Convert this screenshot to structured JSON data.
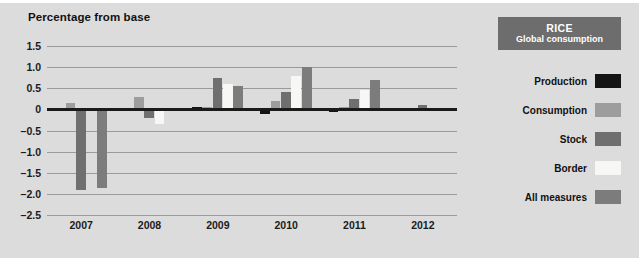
{
  "figure": {
    "background_color": "#dcdcdc",
    "axis_title": "Percentage from base"
  },
  "header": {
    "commodity": "RICE",
    "subtitle": "Global consumption",
    "background_color": "#6d6d6d",
    "text_color": "#ffffff"
  },
  "legend": {
    "position": "right",
    "items": [
      {
        "label": "Production",
        "color": "#141414"
      },
      {
        "label": "Consumption",
        "color": "#9d9d9d"
      },
      {
        "label": "Stock",
        "color": "#6f6f6f"
      },
      {
        "label": "Border",
        "color": "#f7f7f5"
      },
      {
        "label": "All measures",
        "color": "#7c7c7c"
      }
    ]
  },
  "chart_data": {
    "type": "bar",
    "title": "",
    "subtitle": "",
    "xlabel": "",
    "ylabel": "Percentage from base",
    "categories": [
      "2007",
      "2008",
      "2009",
      "2010",
      "2011",
      "2012"
    ],
    "series": [
      {
        "name": "Production",
        "color": "#141414",
        "values": [
          0.0,
          -0.02,
          0.05,
          -0.12,
          -0.06,
          -0.01
        ]
      },
      {
        "name": "Consumption",
        "color": "#9d9d9d",
        "values": [
          0.14,
          0.3,
          0.05,
          0.2,
          0.05,
          0.02
        ]
      },
      {
        "name": "Stock",
        "color": "#6f6f6f",
        "values": [
          -1.9,
          -0.2,
          0.75,
          0.4,
          0.25,
          0.1
        ]
      },
      {
        "name": "Border",
        "color": "#f7f7f5",
        "values": [
          -0.02,
          -0.35,
          0.6,
          0.8,
          0.45,
          0.04
        ]
      },
      {
        "name": "All measures",
        "color": "#7c7c7c",
        "values": [
          -1.85,
          -0.05,
          0.55,
          1.0,
          0.7,
          0.02
        ]
      }
    ],
    "ylim": [
      -2.5,
      1.5
    ],
    "ytick_labels": [
      "1.5",
      "1.0",
      "0.5",
      "0",
      "-0.5",
      "-1.0",
      "-1.5",
      "-2.0",
      "-2.5"
    ],
    "ytick_values": [
      1.5,
      1.0,
      0.5,
      0,
      -0.5,
      -1.0,
      -1.5,
      -2.0,
      -2.5
    ],
    "grid": true,
    "zero_line": true,
    "legend_position": "right"
  }
}
